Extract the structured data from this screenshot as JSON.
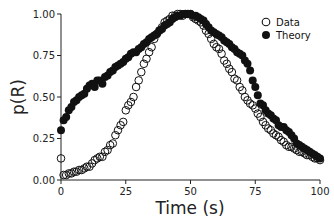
{
  "chart_data": {
    "type": "scatter",
    "title": "",
    "xlabel": "Time (s)",
    "ylabel": "p(R)",
    "xlim": [
      0,
      100
    ],
    "ylim": [
      0,
      1.0
    ],
    "xticks": [
      0,
      25,
      50,
      75,
      100
    ],
    "xtick_labels": [
      "0",
      "25",
      "50",
      "75",
      "100"
    ],
    "yticks": [
      0,
      0.25,
      0.5,
      0.75,
      1.0
    ],
    "ytick_labels": [
      "0.00",
      "0.25",
      "0.50",
      "0.75",
      "1.00"
    ],
    "grid": false,
    "legend_position": "upper right",
    "series": [
      {
        "name": "Data",
        "marker": "open-circle",
        "x": [
          0,
          1,
          2,
          3,
          4,
          5,
          6,
          7,
          8,
          9,
          10,
          11,
          12,
          13,
          14,
          15,
          16,
          17,
          18,
          19,
          20,
          21,
          22,
          23,
          24,
          25,
          26,
          27,
          28,
          29,
          30,
          31,
          32,
          33,
          34,
          35,
          36,
          37,
          38,
          39,
          40,
          41,
          42,
          43,
          44,
          45,
          46,
          47,
          48,
          49,
          50,
          51,
          52,
          53,
          54,
          55,
          56,
          57,
          58,
          59,
          60,
          61,
          62,
          63,
          64,
          65,
          66,
          67,
          68,
          69,
          70,
          71,
          72,
          73,
          74,
          75,
          76,
          77,
          78,
          79,
          80,
          81,
          82,
          83,
          84,
          85,
          86,
          87,
          88,
          89,
          90,
          91,
          92,
          93,
          94,
          95,
          96,
          97,
          98,
          99,
          100
        ],
        "y": [
          0.13,
          0.03,
          0.03,
          0.04,
          0.04,
          0.05,
          0.05,
          0.06,
          0.06,
          0.07,
          0.08,
          0.08,
          0.1,
          0.12,
          0.13,
          0.14,
          0.14,
          0.17,
          0.18,
          0.21,
          0.22,
          0.27,
          0.3,
          0.33,
          0.35,
          0.42,
          0.45,
          0.47,
          0.5,
          0.56,
          0.6,
          0.65,
          0.7,
          0.73,
          0.77,
          0.8,
          0.85,
          0.88,
          0.9,
          0.92,
          0.95,
          0.96,
          0.97,
          0.99,
          0.99,
          1.0,
          1.0,
          0.99,
          1.0,
          1.0,
          1.0,
          0.98,
          0.97,
          0.96,
          0.95,
          0.93,
          0.9,
          0.88,
          0.85,
          0.82,
          0.8,
          0.79,
          0.76,
          0.72,
          0.7,
          0.67,
          0.65,
          0.61,
          0.6,
          0.56,
          0.54,
          0.5,
          0.48,
          0.46,
          0.45,
          0.43,
          0.4,
          0.38,
          0.35,
          0.33,
          0.31,
          0.3,
          0.28,
          0.27,
          0.26,
          0.24,
          0.23,
          0.21,
          0.2,
          0.2,
          0.19,
          0.18,
          0.17,
          0.17,
          0.16,
          0.15,
          0.15,
          0.14,
          0.13,
          0.13,
          0.12
        ]
      },
      {
        "name": "Theory",
        "marker": "filled-circle",
        "x": [
          0,
          1,
          2,
          3,
          4,
          5,
          6,
          7,
          8,
          9,
          10,
          11,
          12,
          13,
          14,
          15,
          16,
          17,
          18,
          19,
          20,
          21,
          22,
          23,
          24,
          25,
          26,
          27,
          28,
          29,
          30,
          31,
          32,
          33,
          34,
          35,
          36,
          37,
          38,
          39,
          40,
          41,
          42,
          43,
          44,
          45,
          46,
          47,
          48,
          49,
          50,
          51,
          52,
          53,
          54,
          55,
          56,
          57,
          58,
          59,
          60,
          61,
          62,
          63,
          64,
          65,
          66,
          67,
          68,
          69,
          70,
          71,
          72,
          73,
          74,
          75,
          76,
          77,
          78,
          79,
          80,
          81,
          82,
          83,
          84,
          85,
          86,
          87,
          88,
          89,
          90,
          91,
          92,
          93,
          94,
          95,
          96,
          97,
          98,
          99,
          100
        ],
        "y": [
          0.3,
          0.36,
          0.38,
          0.42,
          0.44,
          0.47,
          0.48,
          0.5,
          0.51,
          0.52,
          0.55,
          0.57,
          0.58,
          0.56,
          0.6,
          0.6,
          0.58,
          0.62,
          0.63,
          0.65,
          0.66,
          0.68,
          0.69,
          0.7,
          0.71,
          0.73,
          0.74,
          0.76,
          0.77,
          0.77,
          0.79,
          0.8,
          0.82,
          0.83,
          0.85,
          0.86,
          0.87,
          0.88,
          0.9,
          0.91,
          0.93,
          0.94,
          0.95,
          0.97,
          0.98,
          0.99,
          0.99,
          1.0,
          1.0,
          1.0,
          1.0,
          0.99,
          0.99,
          0.98,
          0.97,
          0.96,
          0.94,
          0.92,
          0.9,
          0.89,
          0.88,
          0.87,
          0.86,
          0.84,
          0.83,
          0.82,
          0.8,
          0.79,
          0.77,
          0.76,
          0.75,
          0.72,
          0.7,
          0.66,
          0.6,
          0.56,
          0.51,
          0.46,
          0.45,
          0.42,
          0.4,
          0.39,
          0.37,
          0.36,
          0.33,
          0.32,
          0.32,
          0.3,
          0.29,
          0.27,
          0.25,
          0.22,
          0.21,
          0.2,
          0.19,
          0.18,
          0.17,
          0.16,
          0.15,
          0.14,
          0.13
        ]
      }
    ]
  },
  "legend": {
    "items": [
      {
        "label": "Data",
        "marker": "open-circle"
      },
      {
        "label": "Theory",
        "marker": "filled-circle"
      }
    ]
  },
  "colors": {
    "axis": "#222222",
    "marker": "#111111",
    "background": "#ffffff"
  }
}
